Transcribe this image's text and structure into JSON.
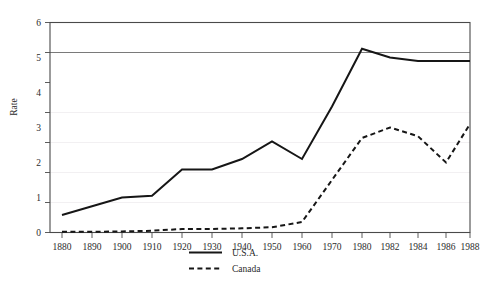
{
  "chart_data": {
    "type": "line",
    "title": "",
    "xlabel": "",
    "ylabel": "Rate",
    "ylim": [
      0,
      6
    ],
    "yticks": [
      0,
      1,
      2,
      3,
      4,
      5,
      6
    ],
    "grid": true,
    "grid_note": "faint horizontal gridlines at each integer; darker emphasized line at y=5",
    "legend_position": "bottom-center",
    "x_axis_note": "categorical/uneven spacing: decades 1880-1980 then 2-year steps to 1988",
    "categories": [
      "1880",
      "1890",
      "1900",
      "1910",
      "1920",
      "1930",
      "1940",
      "1950",
      "1960",
      "1970",
      "1980",
      "1982",
      "1984",
      "1986",
      "1988"
    ],
    "series": [
      {
        "name": "U.S.A.",
        "style": "solid",
        "color": "#161616",
        "values": [
          0.5,
          0.75,
          1.0,
          1.05,
          1.8,
          1.8,
          2.1,
          2.6,
          2.1,
          3.6,
          5.25,
          5.0,
          4.9,
          4.9,
          4.9
        ]
      },
      {
        "name": "Canada",
        "style": "dashed",
        "color": "#161616",
        "values": [
          0.02,
          0.02,
          0.03,
          0.05,
          0.1,
          0.1,
          0.12,
          0.15,
          0.3,
          1.5,
          2.7,
          3.0,
          2.75,
          2.0,
          3.1
        ]
      }
    ]
  },
  "axes": {
    "y_title": "Rate",
    "y_tick_labels": [
      "0",
      "1",
      "2",
      "3",
      "4",
      "5",
      "6"
    ],
    "x_tick_labels": [
      "1880",
      "1890",
      "1900",
      "1910",
      "1920",
      "1930",
      "1940",
      "1950",
      "1960",
      "1970",
      "1980",
      "1982",
      "1984",
      "1986",
      "1988"
    ]
  },
  "legend": {
    "entries": [
      {
        "label": "U.S.A.",
        "style": "solid"
      },
      {
        "label": "Canada",
        "style": "dashed"
      }
    ]
  },
  "colors": {
    "line": "#161616",
    "frame": "#4a4a4a",
    "grid": "#f0eef0",
    "grid_major": "#6b6b6b",
    "background": "#ffffff",
    "text": "#2b2b2b"
  }
}
